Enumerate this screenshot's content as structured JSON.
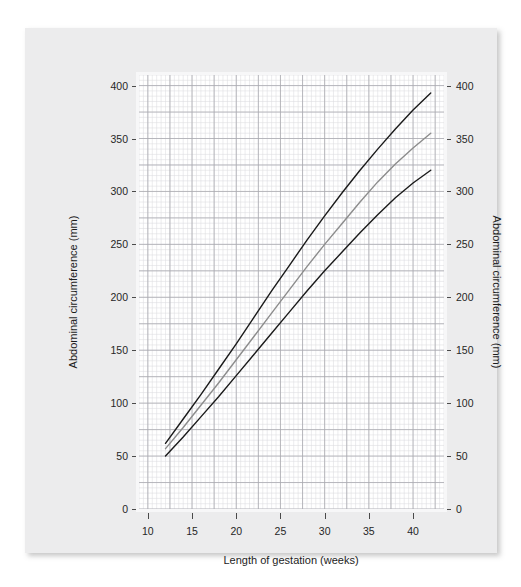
{
  "chart_data": {
    "type": "line",
    "title": "",
    "xlabel": "Length of gestation (weeks)",
    "ylabel": "Abdominal circumference (mm)",
    "ylabel_right": "Abdominal circumference (mm)",
    "xlim": [
      9,
      43.5
    ],
    "ylim": [
      0,
      410
    ],
    "xticks": [
      10,
      15,
      20,
      25,
      30,
      35,
      40
    ],
    "yticks": [
      0,
      50,
      100,
      150,
      200,
      250,
      300,
      350,
      400
    ],
    "xtick_labels": [
      "10",
      "15",
      "20",
      "25",
      "30",
      "35",
      "40"
    ],
    "ytick_labels": [
      "0",
      "50",
      "100",
      "150",
      "200",
      "250",
      "300",
      "350",
      "400"
    ],
    "grid": true,
    "grid_minor_step_x": 0.5,
    "grid_minor_step_y": 5,
    "grid_major_step_x": 2.5,
    "grid_major_step_y": 25,
    "legend": "none",
    "x": [
      12,
      14,
      16,
      18,
      20,
      22,
      24,
      26,
      28,
      30,
      32,
      34,
      36,
      38,
      40,
      42
    ],
    "series": [
      {
        "name": "97th centile",
        "color": "#1a1a1a",
        "width": 1.4,
        "values": [
          62,
          85,
          108,
          132,
          156,
          181,
          206,
          230,
          254,
          277,
          299,
          320,
          340,
          359,
          377,
          393
        ]
      },
      {
        "name": "50th centile",
        "color": "#8c8c8c",
        "width": 1.4,
        "values": [
          57,
          77,
          98,
          119,
          141,
          163,
          185,
          207,
          229,
          250,
          270,
          290,
          309,
          326,
          341,
          355
        ]
      },
      {
        "name": "3rd centile",
        "color": "#1a1a1a",
        "width": 1.4,
        "values": [
          50,
          68,
          87,
          106,
          126,
          146,
          166,
          186,
          206,
          225,
          243,
          261,
          278,
          294,
          308,
          320
        ]
      }
    ]
  },
  "figure": {
    "panel_background": "#ececed",
    "plot_background": "#ffffff",
    "grid_minor_color": "#dcdce0",
    "grid_major_color": "#aaaab0",
    "axis_text_color": "#262626"
  }
}
